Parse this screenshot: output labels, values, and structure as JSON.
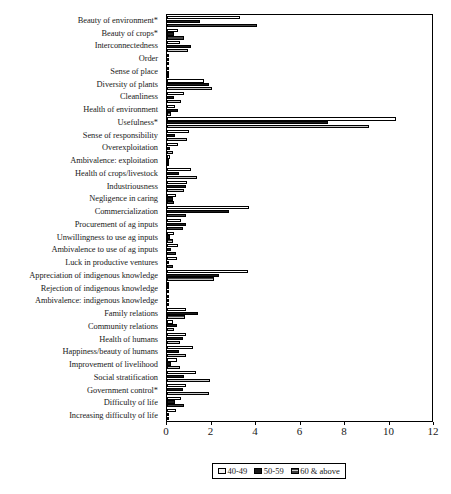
{
  "chart_data": {
    "type": "bar",
    "orientation": "horizontal",
    "title": "",
    "xlabel": "",
    "ylabel": "",
    "xlim": [
      0,
      12
    ],
    "xticks": [
      0,
      2,
      4,
      6,
      8,
      10,
      12
    ],
    "grid": false,
    "legend_position": "bottom-center",
    "categories": [
      "Beauty of environment*",
      "Beauty of crops*",
      "Interconnectedness",
      "Order",
      "Sense of place",
      "Diversity of plants",
      "Cleanliness",
      "Health of environment",
      "Usefulness*",
      "Sense of responsibility",
      "Overexploitation",
      "Ambivalence: exploitation",
      "Health of crops/livestock",
      "Industriousness",
      "Negligence in caring",
      "Commercialization",
      "Procurement of ag inputs",
      "Unwillingness to use ag inputs",
      "Ambivalence to use of ag inputs",
      "Luck in productive ventures",
      "Appreciation of indigenous knowledge",
      "Rejection of indigenous knowledge",
      "Ambivalence: indigenous knowledge",
      "Family relations",
      "Community relations",
      "Health of humans",
      "Happiness/beauty of humans",
      "Improvement of livelihood",
      "Social stratification",
      "Government control*",
      "Difficulty of life",
      "Increasing difficulty of life"
    ],
    "series": [
      {
        "name": "40-49",
        "color": "#ffffff",
        "values": [
          3.3,
          0.5,
          0.6,
          0.1,
          0.05,
          1.65,
          0.75,
          0.35,
          10.3,
          1.0,
          0.5,
          0.15,
          1.1,
          0.9,
          0.4,
          3.7,
          0.65,
          0.3,
          0.5,
          0.45,
          3.65,
          0.05,
          0.05,
          0.85,
          0.25,
          0.85,
          1.15,
          0.45,
          1.3,
          0.85,
          0.65,
          0.4
        ]
      },
      {
        "name": "50-59",
        "color": "#1a1a1a",
        "values": [
          1.5,
          0.3,
          1.1,
          0.05,
          0.0,
          1.9,
          0.3,
          0.5,
          7.25,
          0.35,
          0.15,
          0.05,
          0.55,
          0.85,
          0.25,
          2.8,
          0.85,
          0.15,
          0.2,
          0.1,
          2.35,
          0.0,
          0.0,
          1.4,
          0.45,
          0.7,
          0.55,
          0.2,
          0.75,
          0.7,
          0.35,
          0.0
        ]
      },
      {
        "name": "60 & above",
        "color": "#9a9a9a",
        "values": [
          4.05,
          0.75,
          0.95,
          0.05,
          0.0,
          2.0,
          0.65,
          0.2,
          9.1,
          0.9,
          0.25,
          0.1,
          1.35,
          0.75,
          0.3,
          0.85,
          0.7,
          0.25,
          0.4,
          0.25,
          2.1,
          0.0,
          0.0,
          0.8,
          0.3,
          0.6,
          0.85,
          0.6,
          1.95,
          1.9,
          0.75,
          0.0
        ]
      }
    ]
  },
  "legend": {
    "entries": [
      {
        "label": "40-49"
      },
      {
        "label": "50-59"
      },
      {
        "label": "60 & above"
      }
    ]
  },
  "axis": {
    "tick_labels": [
      "0",
      "2",
      "4",
      "6",
      "8",
      "10",
      "12"
    ]
  }
}
